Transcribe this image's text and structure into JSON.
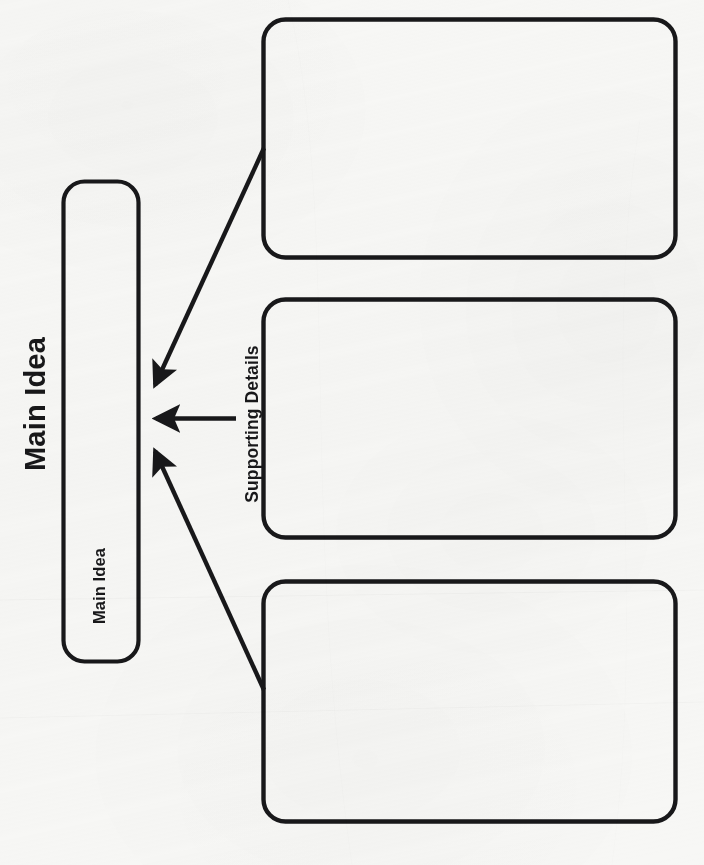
{
  "worksheet": {
    "title": "Main Idea",
    "background_color": "#f7f7f5",
    "ink_color": "#18181a",
    "orientation": "rotated-90-counterclockwise"
  },
  "main_idea": {
    "label": "Main Idea",
    "box_value": ""
  },
  "supporting_details": {
    "label": "Supporting Details",
    "boxes": [
      {
        "name": "supporting-detail-1",
        "value": ""
      },
      {
        "name": "supporting-detail-2",
        "value": ""
      },
      {
        "name": "supporting-detail-3",
        "value": ""
      }
    ]
  },
  "arrows": [
    {
      "name": "arrow-detail-1-to-main-idea",
      "direction": "diagonal-down-left"
    },
    {
      "name": "arrow-detail-2-to-main-idea",
      "direction": "horizontal-left"
    },
    {
      "name": "arrow-detail-3-to-main-idea",
      "direction": "diagonal-up-left"
    }
  ]
}
